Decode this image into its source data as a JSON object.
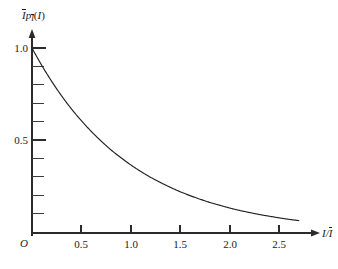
{
  "figure": {
    "background_color": "#ffffff",
    "curve_color": "#222222",
    "axis_color": "#2b2b2b",
    "origin_label": "O",
    "y_axis_title_parts": {
      "i_bar": "I",
      "p": "p",
      "p_sub": "I",
      "arg_open": "(",
      "arg": "I",
      "arg_close": ")"
    },
    "x_axis_title_parts": {
      "numerator": "I",
      "slash": "/",
      "denominator": "I"
    }
  },
  "chart_data": {
    "type": "line",
    "title": "",
    "subtitle": "",
    "xlabel": "I/Ī",
    "ylabel": "Ī p_Ī(I)",
    "xlim": [
      0,
      2.75
    ],
    "ylim": [
      0,
      1.08
    ],
    "grid": false,
    "legend": null,
    "x_ticks_major": [
      0.5,
      1.0,
      1.5,
      2.0,
      2.5
    ],
    "x_tick_labels": [
      "0.5",
      "1.0",
      "1.5",
      "2.0",
      "2.5"
    ],
    "y_ticks_major": [
      0.5,
      1.0
    ],
    "y_tick_labels": [
      "0.5",
      "1.0"
    ],
    "y_ticks_minor": [
      0.1,
      0.2,
      0.3,
      0.4,
      0.6,
      0.7,
      0.8,
      0.9
    ],
    "annotations": [],
    "series": [
      {
        "name": "exponential intensity density",
        "expression": "exp(-x)",
        "x": [
          0.0,
          0.1,
          0.2,
          0.3,
          0.4,
          0.5,
          0.6,
          0.7,
          0.8,
          0.9,
          1.0,
          1.1,
          1.2,
          1.3,
          1.4,
          1.5,
          1.6,
          1.7,
          1.8,
          1.9,
          2.0,
          2.1,
          2.2,
          2.3,
          2.4,
          2.5,
          2.6,
          2.7
        ],
        "y": [
          1.0,
          0.905,
          0.819,
          0.741,
          0.67,
          0.607,
          0.549,
          0.497,
          0.449,
          0.407,
          0.368,
          0.333,
          0.301,
          0.273,
          0.247,
          0.223,
          0.202,
          0.183,
          0.165,
          0.15,
          0.135,
          0.122,
          0.111,
          0.1,
          0.091,
          0.082,
          0.074,
          0.067
        ]
      }
    ]
  }
}
